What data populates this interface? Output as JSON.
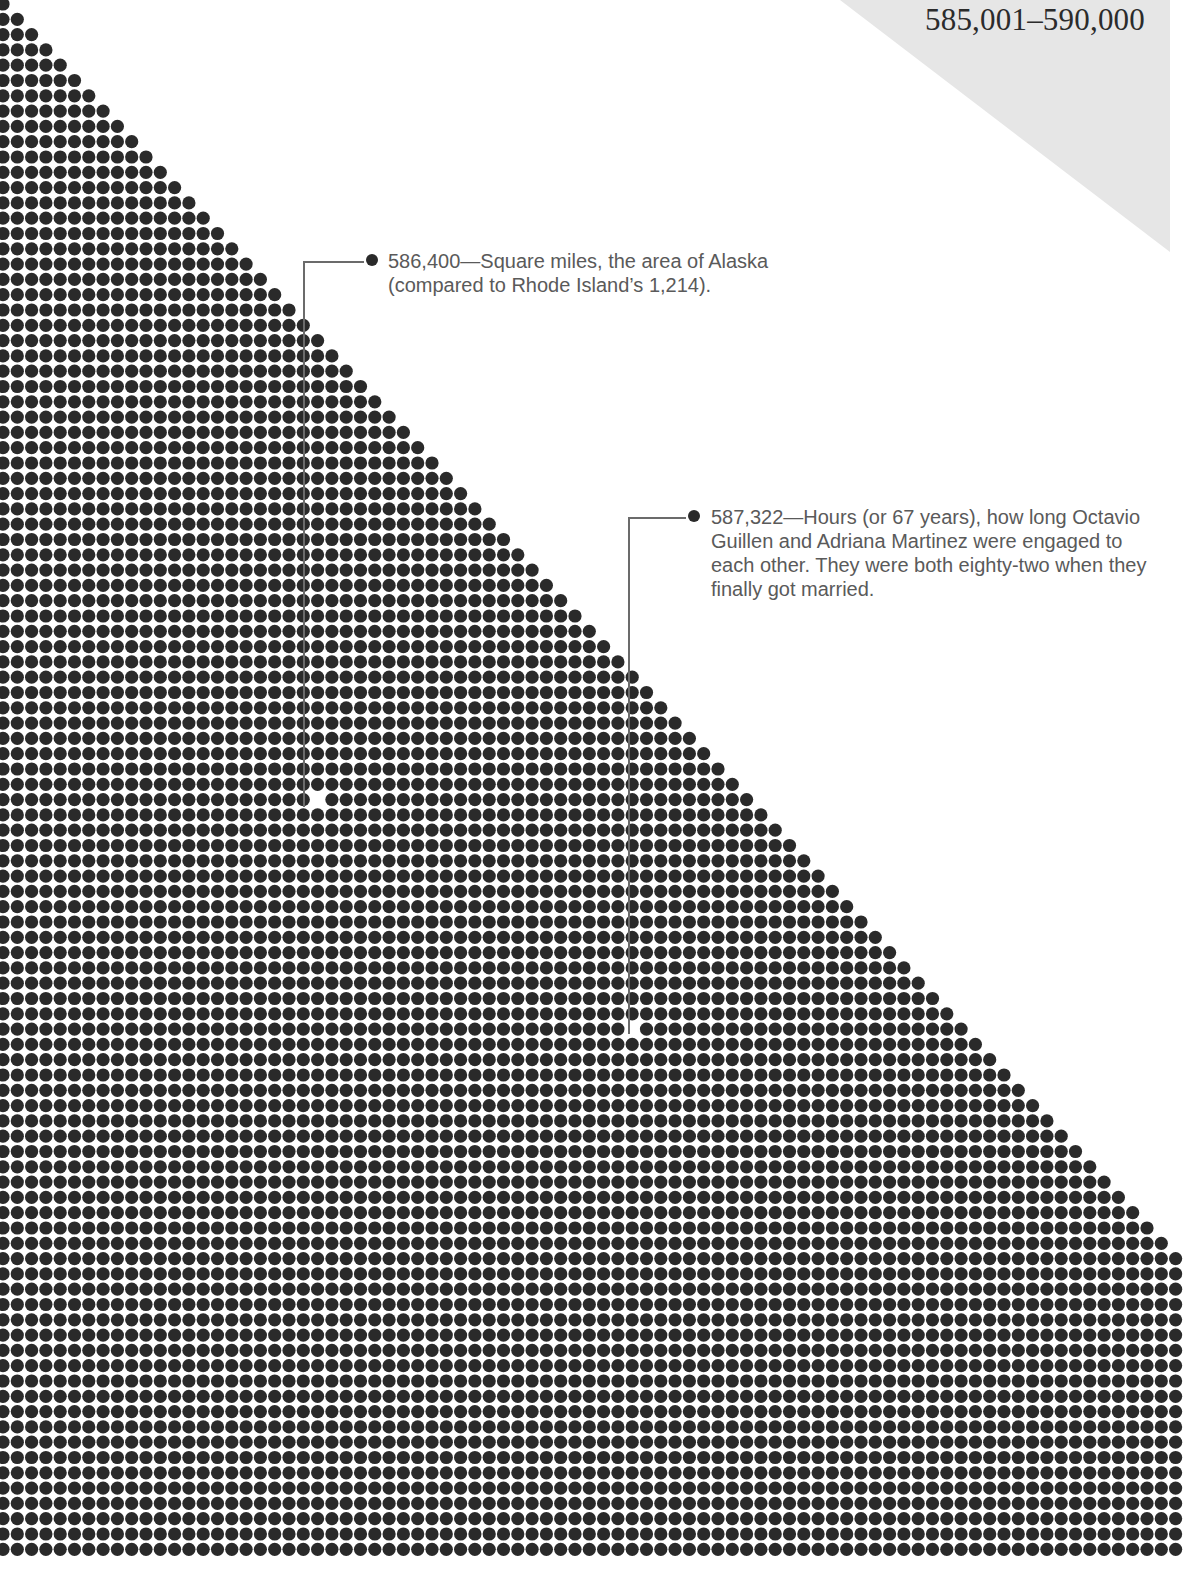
{
  "header": {
    "range_title": "585,001–590,000"
  },
  "colors": {
    "dot": "#2a2a2a",
    "leader": "#6b6b6b",
    "corner_triangle": "#e6e6e6",
    "text": "#5a5a5a",
    "title": "#2b2b2b"
  },
  "chart_data": {
    "type": "dot-matrix",
    "title": "585,001–590,000",
    "grid": {
      "origin_x": 3,
      "origin_y": 4,
      "pitch_x": 14.3,
      "pitch_y": 15.3,
      "dot_radius": 6.6,
      "rows": 102,
      "cols": 83,
      "first_row_dots": 1,
      "dots_added_per_row": 1
    },
    "annotations": [
      {
        "value": "586,400",
        "label": "586,400—Square miles, the area of Alaska (compared to Rhode Island’s 1,214).",
        "highlight_dot": {
          "x": 314,
          "y": 801
        },
        "leader": {
          "bullet_x": 372,
          "bullet_y": 260,
          "corner_x": 304,
          "corner_y": 262
        }
      },
      {
        "value": "587,322",
        "label": "587,322—Hours (or 67 years), how long Octavio Guillen and Adriana Martinez were engaged to each other. They were both eighty-two when they finally got married.",
        "highlight_dot": {
          "x": 639,
          "y": 1028
        },
        "leader": {
          "bullet_x": 694,
          "bullet_y": 516,
          "corner_x": 629,
          "corner_y": 518
        }
      }
    ]
  },
  "callouts": [
    {
      "text": "586,400—Square miles, the area of Alaska (compared to Rhode Island’s 1,214)."
    },
    {
      "text": "587,322—Hours (or 67 years), how long Octavio Guillen and Adriana Martinez were engaged to each other. They were both eighty-two when they finally got married."
    }
  ]
}
